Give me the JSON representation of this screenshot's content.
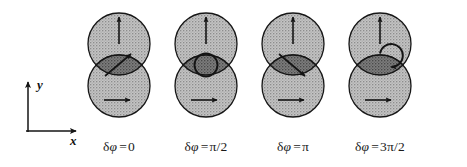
{
  "figure": {
    "background_color": "#ffffff",
    "ink_color": "#1a1a1a",
    "circle_fill_color": "#b6b6b6",
    "lens_fill_color": "#6e6e6e",
    "stroke_color": "#161616",
    "width": 467,
    "height": 167
  },
  "axes": {
    "name": "coordinate-axes",
    "origin_x": 28,
    "origin_y": 132,
    "y_axis": {
      "label": "y",
      "length": 52,
      "label_x": 37,
      "label_y": 84
    },
    "x_axis": {
      "label": "x",
      "length": 50,
      "label_x": 72,
      "label_y": 140
    }
  },
  "panels": [
    {
      "id": "panel-1",
      "center_x": 119,
      "caption_delta": "δ",
      "caption_phi": "φ",
      "caption_eq": "=",
      "caption_value": "0",
      "caption_full": "δφ = 0",
      "upper_circle": {
        "arrow": "up-arrow",
        "polarization": "vertical"
      },
      "lower_circle": {
        "arrow": "right-arrow",
        "polarization": "horizontal"
      },
      "lens_marker": {
        "type": "diagonal-arrow",
        "direction": "up-right",
        "angle_deg": -45,
        "state": "linear +45"
      }
    },
    {
      "id": "panel-2",
      "center_x": 206,
      "caption_delta": "δ",
      "caption_phi": "φ",
      "caption_eq": "=",
      "caption_value": "π/2",
      "caption_full": "δφ = π/2",
      "upper_circle": {
        "arrow": "up-arrow",
        "polarization": "vertical"
      },
      "lower_circle": {
        "arrow": "right-arrow",
        "polarization": "horizontal"
      },
      "lens_marker": {
        "type": "ring",
        "direction": "none",
        "angle_deg": 0,
        "state": "circular"
      }
    },
    {
      "id": "panel-3",
      "center_x": 293,
      "caption_delta": "δ",
      "caption_phi": "φ",
      "caption_eq": "=",
      "caption_value": "π",
      "caption_full": "δφ = π",
      "upper_circle": {
        "arrow": "up-arrow",
        "polarization": "vertical"
      },
      "lower_circle": {
        "arrow": "right-arrow",
        "polarization": "horizontal"
      },
      "lens_marker": {
        "type": "diagonal-arrow",
        "direction": "down-right",
        "angle_deg": 45,
        "state": "linear -45"
      }
    },
    {
      "id": "panel-4",
      "center_x": 380,
      "caption_delta": "δ",
      "caption_phi": "φ",
      "caption_eq": "=",
      "caption_value": "3π/2",
      "caption_full": "δφ = 3π/2",
      "upper_circle": {
        "arrow": "up-arrow",
        "polarization": "vertical"
      },
      "lower_circle": {
        "arrow": "right-arrow",
        "polarization": "horizontal"
      },
      "lens_marker": {
        "type": "ring-with-arrowhead",
        "direction": "clockwise",
        "angle_deg": 0,
        "state": "circular opposite handedness"
      }
    }
  ],
  "geometry": {
    "circle_radius": 31,
    "upper_center_y": 44,
    "lower_center_y": 86,
    "ring_radius": 12,
    "caption_y": 140
  }
}
